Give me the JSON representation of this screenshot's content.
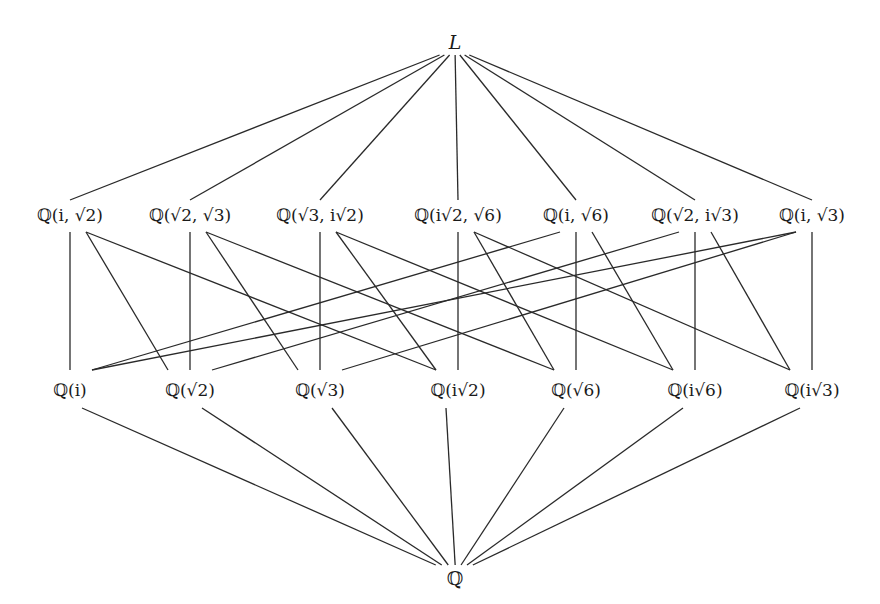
{
  "layout": {
    "width": 880,
    "height": 604
  },
  "top": {
    "label": "L",
    "x": 455,
    "y": 42,
    "edge_y": 55
  },
  "bottom": {
    "label": "ℚ",
    "x": 455,
    "y": 578,
    "edge_y": 565
  },
  "quartic_fields": {
    "y": 215,
    "edge_top_y": 200,
    "edge_bottom_y": 232,
    "items": [
      {
        "id": "Q_i_s2",
        "label": "ℚ(i, √2)",
        "x": 70
      },
      {
        "id": "Q_s2_s3",
        "label": "ℚ(√2, √3)",
        "x": 190
      },
      {
        "id": "Q_s3_is2",
        "label": "ℚ(√3, i√2)",
        "x": 320
      },
      {
        "id": "Q_is2_s6",
        "label": "ℚ(i√2, √6)",
        "x": 458
      },
      {
        "id": "Q_i_s6",
        "label": "ℚ(i, √6)",
        "x": 576
      },
      {
        "id": "Q_s2_is3",
        "label": "ℚ(√2, i√3)",
        "x": 695
      },
      {
        "id": "Q_i_s3",
        "label": "ℚ(i, √3)",
        "x": 812
      }
    ]
  },
  "quadratic_fields": {
    "y": 390,
    "edge_top_y": 370,
    "edge_bottom_y": 408,
    "items": [
      {
        "id": "Q_i",
        "label": "ℚ(i)",
        "x": 70
      },
      {
        "id": "Q_s2",
        "label": "ℚ(√2)",
        "x": 190
      },
      {
        "id": "Q_s3",
        "label": "ℚ(√3)",
        "x": 320
      },
      {
        "id": "Q_is2",
        "label": "ℚ(i√2)",
        "x": 458
      },
      {
        "id": "Q_s6",
        "label": "ℚ(√6)",
        "x": 576
      },
      {
        "id": "Q_is6",
        "label": "ℚ(i√6)",
        "x": 695
      },
      {
        "id": "Q_is3",
        "label": "ℚ(i√3)",
        "x": 812
      }
    ]
  },
  "inclusions": [
    [
      "Q_i_s2",
      "Q_i"
    ],
    [
      "Q_i_s2",
      "Q_s2"
    ],
    [
      "Q_i_s2",
      "Q_is2"
    ],
    [
      "Q_s2_s3",
      "Q_s2"
    ],
    [
      "Q_s2_s3",
      "Q_s3"
    ],
    [
      "Q_s2_s3",
      "Q_s6"
    ],
    [
      "Q_s3_is2",
      "Q_s3"
    ],
    [
      "Q_s3_is2",
      "Q_is2"
    ],
    [
      "Q_s3_is2",
      "Q_is6"
    ],
    [
      "Q_is2_s6",
      "Q_is2"
    ],
    [
      "Q_is2_s6",
      "Q_s6"
    ],
    [
      "Q_is2_s6",
      "Q_is3"
    ],
    [
      "Q_i_s6",
      "Q_i"
    ],
    [
      "Q_i_s6",
      "Q_s6"
    ],
    [
      "Q_i_s6",
      "Q_is6"
    ],
    [
      "Q_s2_is3",
      "Q_s2"
    ],
    [
      "Q_s2_is3",
      "Q_is3"
    ],
    [
      "Q_s2_is3",
      "Q_is6"
    ],
    [
      "Q_i_s3",
      "Q_i"
    ],
    [
      "Q_i_s3",
      "Q_s3"
    ],
    [
      "Q_i_s3",
      "Q_is3"
    ]
  ],
  "colors": {
    "line": "#2a2a2a",
    "text": "#1a1a1a",
    "background": "#ffffff"
  }
}
